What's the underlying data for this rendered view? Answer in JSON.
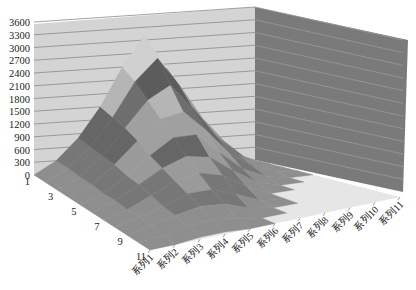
{
  "chart_data": {
    "type": "surface3d",
    "title": "",
    "xlabel": "",
    "ylabel": "",
    "zlabel": "",
    "y_axis": {
      "ticks": [
        "0",
        "300",
        "600",
        "900",
        "1200",
        "1500",
        "1800",
        "2100",
        "2400",
        "2700",
        "3000",
        "3300",
        "3600"
      ],
      "range": [
        0,
        3600
      ],
      "gridlines": true
    },
    "depth_axis": {
      "ticks": [
        "1",
        "3",
        "5",
        "7",
        "9",
        "11"
      ]
    },
    "x_axis": {
      "ticks": [
        "系列1",
        "系列2",
        "系列3",
        "系列4",
        "系列5",
        "系列6",
        "系列7",
        "系列8",
        "系列9",
        "系列10",
        "系列11"
      ]
    },
    "categories": [
      "系列1",
      "系列2",
      "系列3",
      "系列4",
      "系列5",
      "系列6",
      "系列7",
      "系列8",
      "系列9",
      "系列10",
      "系列11"
    ],
    "rows": [
      1,
      2,
      3,
      4,
      5,
      6,
      7,
      8,
      9,
      10,
      11
    ],
    "series": [
      {
        "name": "1",
        "values": [
          0,
          300,
          800,
          1500,
          2400,
          3100,
          2300,
          1400,
          700,
          200,
          0
        ]
      },
      {
        "name": "2",
        "values": [
          0,
          300,
          750,
          1400,
          2200,
          2700,
          2000,
          1200,
          600,
          150,
          0
        ]
      },
      {
        "name": "3",
        "values": [
          0,
          250,
          700,
          1300,
          1900,
          2200,
          1600,
          900,
          400,
          100,
          0
        ]
      },
      {
        "name": "4",
        "values": [
          0,
          250,
          650,
          1150,
          1600,
          1700,
          1200,
          600,
          250,
          50,
          0
        ]
      },
      {
        "name": "5",
        "values": [
          0,
          200,
          550,
          950,
          1300,
          1300,
          800,
          350,
          100,
          0,
          0
        ]
      },
      {
        "name": "6",
        "values": [
          0,
          200,
          500,
          800,
          1000,
          900,
          500,
          150,
          0,
          0,
          0
        ]
      },
      {
        "name": "7",
        "values": [
          0,
          150,
          400,
          650,
          750,
          600,
          250,
          0,
          0,
          0,
          0
        ]
      },
      {
        "name": "8",
        "values": [
          0,
          150,
          300,
          500,
          500,
          300,
          50,
          0,
          0,
          0,
          0
        ]
      },
      {
        "name": "9",
        "values": [
          0,
          100,
          250,
          350,
          300,
          100,
          0,
          0,
          0,
          0,
          0
        ]
      },
      {
        "name": "10",
        "values": [
          0,
          50,
          150,
          200,
          100,
          0,
          0,
          0,
          0,
          0,
          0
        ]
      },
      {
        "name": "11",
        "values": [
          0,
          0,
          50,
          50,
          0,
          0,
          0,
          0,
          0,
          0,
          0
        ]
      }
    ],
    "legend": "none",
    "grid": true
  }
}
